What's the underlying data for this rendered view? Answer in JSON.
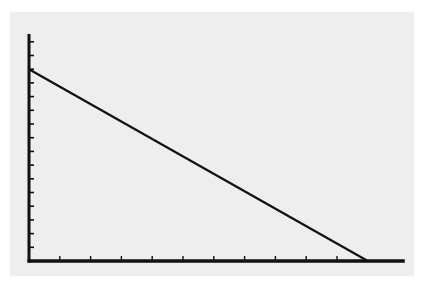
{
  "chart_data": {
    "type": "line",
    "title": "",
    "xlabel": "",
    "ylabel": "",
    "x": [
      0,
      11
    ],
    "series": [
      {
        "name": "line",
        "values": [
          14,
          0
        ]
      }
    ],
    "x_ticks": [
      1,
      2,
      3,
      4,
      5,
      6,
      7,
      8,
      9,
      10
    ],
    "y_ticks": [
      1,
      2,
      3,
      4,
      5,
      6,
      7,
      8,
      9,
      10,
      11,
      12,
      13,
      14,
      15,
      16
    ],
    "xlim": [
      0,
      12.2
    ],
    "ylim": [
      0,
      16.5
    ],
    "grid": false,
    "legend": null,
    "colors": {
      "line": "#111111",
      "axis": "#111111",
      "panel": "#eeeeee",
      "background": "#ffffff"
    }
  }
}
